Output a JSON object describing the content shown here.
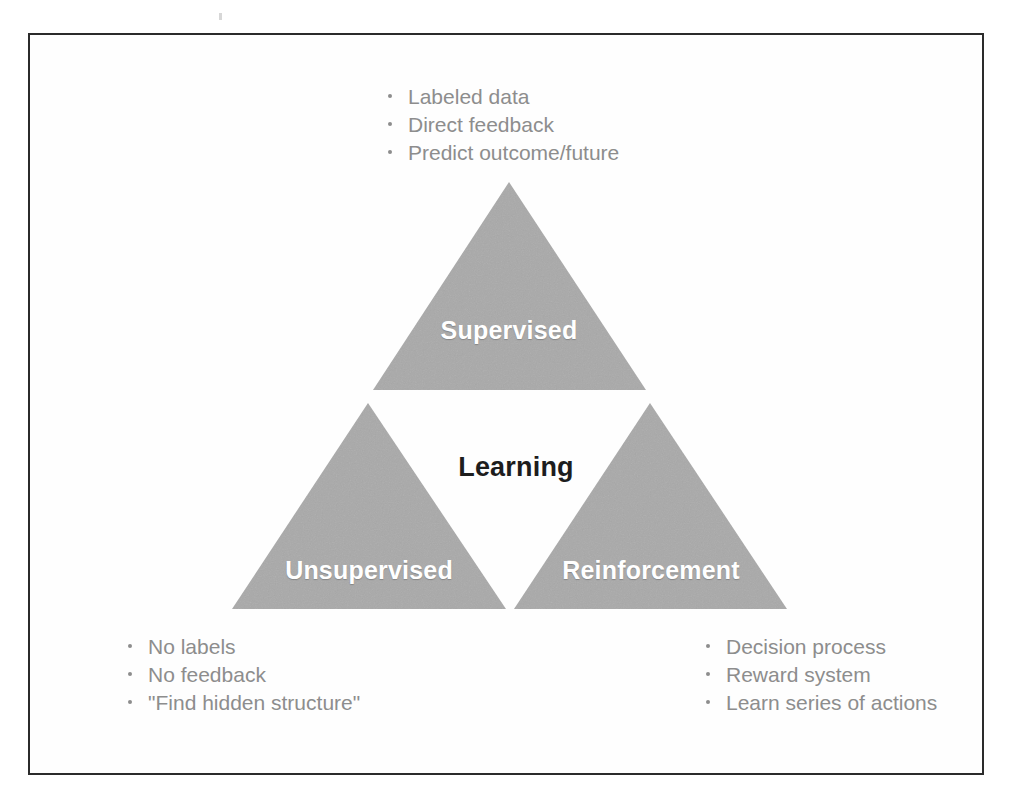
{
  "slide": {
    "center_label": "Learning",
    "triangles": [
      {
        "id": "supervised",
        "label": "Supervised",
        "fill": "#a9a9a9",
        "apex": [
          509,
          182
        ],
        "left": [
          373,
          390
        ],
        "right": [
          646,
          390
        ]
      },
      {
        "id": "unsupervised",
        "label": "Unsupervised",
        "fill": "#a9a9a9",
        "apex": [
          368,
          403
        ],
        "left": [
          232,
          609
        ],
        "right": [
          506,
          609
        ]
      },
      {
        "id": "reinforcement",
        "label": "Reinforcement",
        "fill": "#a9a9a9",
        "apex": [
          650,
          403
        ],
        "left": [
          514,
          609
        ],
        "right": [
          787,
          609
        ]
      }
    ],
    "lists": [
      {
        "id": "supervised",
        "items": [
          "Labeled data",
          "Direct feedback",
          "Predict outcome/future"
        ]
      },
      {
        "id": "unsupervised",
        "items": [
          "No labels",
          "No feedback",
          "\"Find hidden structure\""
        ]
      },
      {
        "id": "reinforcement",
        "items": [
          "Decision process",
          "Reward system",
          "Learn series of actions"
        ]
      }
    ],
    "colors": {
      "triangle_fill": "#a9a9a9",
      "triangle_label": "#ffffff",
      "center_label": "#1d1d1d",
      "bullet_text": "#8d8d8d",
      "frame_border": "#2b2b2b",
      "background": "#ffffff"
    }
  }
}
